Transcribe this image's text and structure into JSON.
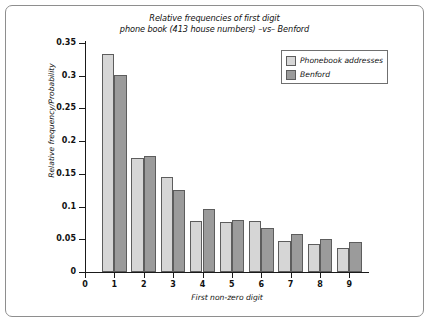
{
  "chart_data": {
    "type": "bar",
    "title": "Relative frequencies of first digit\nphone book (413 house numbers) –vs– Benford",
    "title_line1": "Relative frequencies of first digit",
    "title_line2": "phone book (413 house numbers) –vs– Benford",
    "xlabel": "First non-zero digit",
    "ylabel": "Relative frequency/Probability",
    "categories": [
      "1",
      "2",
      "3",
      "4",
      "5",
      "6",
      "7",
      "8",
      "9"
    ],
    "xticks": [
      "0",
      "1",
      "2",
      "3",
      "4",
      "5",
      "6",
      "7",
      "8",
      "9"
    ],
    "yticks": [
      "0",
      "0.05",
      "0.1",
      "0.15",
      "0.2",
      "0.25",
      "0.3",
      "0.35"
    ],
    "ytick_values": [
      0,
      0.05,
      0.1,
      0.15,
      0.2,
      0.25,
      0.3,
      0.35
    ],
    "ylim": [
      0,
      0.35
    ],
    "xlim": [
      0,
      9.6
    ],
    "grid": false,
    "legend_position": "top-right",
    "series": [
      {
        "name": "Phonebook addresses",
        "color": "#d6d6d6",
        "values": [
          0.333,
          0.175,
          0.145,
          0.078,
          0.076,
          0.078,
          0.048,
          0.043,
          0.037
        ]
      },
      {
        "name": "Benford",
        "color": "#9b9b9b",
        "values": [
          0.301,
          0.178,
          0.125,
          0.097,
          0.079,
          0.068,
          0.058,
          0.051,
          0.046
        ]
      }
    ]
  },
  "colors": {
    "series_light": "#d6d6d6",
    "series_dark": "#9b9b9b",
    "bar_border": "#5d5d5d",
    "axis": "#1a1a1a",
    "frame": "#8e8e8e",
    "background": "#ffffff"
  }
}
